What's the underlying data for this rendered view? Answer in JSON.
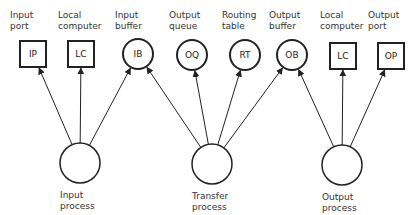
{
  "diagram": {
    "type": "process-resource-graph",
    "resources": [
      {
        "id": "IP",
        "abbr": "IP",
        "label_line1": "Input",
        "label_line2": "port",
        "shape": "square",
        "cx": 33,
        "cy": 54
      },
      {
        "id": "LC1",
        "abbr": "LC",
        "label_line1": "Local",
        "label_line2": "computer",
        "shape": "square",
        "cx": 81,
        "cy": 54
      },
      {
        "id": "IB",
        "abbr": "IB",
        "label_line1": "Input",
        "label_line2": "buffer",
        "shape": "circle",
        "cx": 138,
        "cy": 54
      },
      {
        "id": "OQ",
        "abbr": "OQ",
        "label_line1": "Output",
        "label_line2": "queue",
        "shape": "circle",
        "cx": 192,
        "cy": 55
      },
      {
        "id": "RT",
        "abbr": "RT",
        "label_line1": "Routing",
        "label_line2": "table",
        "shape": "circle",
        "cx": 245,
        "cy": 55
      },
      {
        "id": "OB",
        "abbr": "OB",
        "label_line1": "Output",
        "label_line2": "buffer",
        "shape": "circle",
        "cx": 292,
        "cy": 55
      },
      {
        "id": "LC2",
        "abbr": "LC",
        "label_line1": "Local",
        "label_line2": "computer",
        "shape": "square",
        "cx": 343,
        "cy": 56
      },
      {
        "id": "OP",
        "abbr": "OP",
        "label_line1": "Output",
        "label_line2": "port",
        "shape": "square",
        "cx": 391,
        "cy": 56
      }
    ],
    "processes": [
      {
        "id": "input",
        "label_line1": "Input",
        "label_line2": "process",
        "cx": 80,
        "cy": 163
      },
      {
        "id": "transfer",
        "label_line1": "Transfer",
        "label_line2": "process",
        "cx": 212,
        "cy": 164
      },
      {
        "id": "output",
        "label_line1": "Output",
        "label_line2": "process",
        "cx": 342,
        "cy": 165
      }
    ],
    "edges": [
      {
        "from": "input",
        "to": "IP"
      },
      {
        "from": "input",
        "to": "LC1"
      },
      {
        "from": "input",
        "to": "IB"
      },
      {
        "from": "transfer",
        "to": "IB"
      },
      {
        "from": "transfer",
        "to": "OQ"
      },
      {
        "from": "transfer",
        "to": "RT"
      },
      {
        "from": "transfer",
        "to": "OB"
      },
      {
        "from": "output",
        "to": "OB"
      },
      {
        "from": "output",
        "to": "LC2"
      },
      {
        "from": "output",
        "to": "OP"
      }
    ]
  }
}
